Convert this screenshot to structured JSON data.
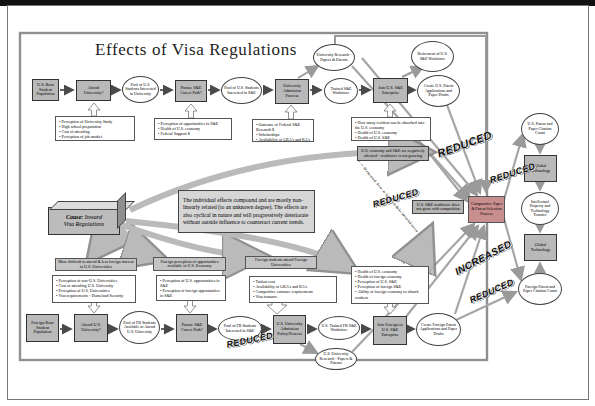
{
  "page_title": "Effects of Visa Regulations",
  "cause_box": {
    "keyword": "Cause:",
    "line1_rest": " Inward",
    "line2": "Visa Regulations"
  },
  "center_note": "The individual effects compound and are mostly non-linearly related (to an unknown degree).  The effects are also cyclical in nature and will progressively deteriorate without outside influence to counteract current trends.",
  "top_row": {
    "n1": "U.S. Born Student Population",
    "n2": "Attend University?",
    "n3": "Pool of U.S. Students Interested in University",
    "n4": "Pursue S&E Career Path?",
    "n5": "Pool of U.S. Students Interested in S&E",
    "n6": "University Admission Process",
    "n7": "Trained S&E Workforce",
    "n8": "Join U.S. S&E Enterprise",
    "n9": "Create U.S. Patent Applications and Paper Drafts",
    "research": "University Research - Papers & Patents",
    "retirement": "Retirement of U.S. S&E Workforce"
  },
  "bottom_row": {
    "n1": "Foreign Born Student Population",
    "n2": "Attend U.S. University?",
    "n3": "Pool of FB Students Available to Attend U.S. University",
    "n4": "Pursue S&E Career Path?",
    "n5": "Pool of FB Students Interested in S&E",
    "n6": "U.S. University Admission Policy/Process",
    "n7": "U.S. Trained FB S&E Workforce",
    "n8": "Join Foreign or U.S. S&E Enterprise",
    "n9": "Create Foreign Patent Applications and Paper Drafts",
    "research": "U.S. University Research - Papers & Patents"
  },
  "right_column": {
    "comparative": "Comparative Paper & Patent Selection Process",
    "us_citations": "U.S. Patent and Paper Citation Count",
    "global_tech_top": "Global Technology",
    "ip_transfer": "Intellectual Property and Technology Transfer",
    "global_tech_bottom": "Global Technology",
    "foreign_citations": "Foreign Patent and Paper Citation Count"
  },
  "labels": {
    "economy_affected": "U.S. economy and S&E are negatively affected - workforce is not growing",
    "workforce_not_grow": "U.S. S&E workforce does not grow with competition",
    "demand_diagonal": "Demand for a U.S. S&E Workforce",
    "more_difficult": "More difficult to attend & less foreign interest in U.S. Universities",
    "foreign_perception": "Foreign perception of opportunities available in U.S. Economy",
    "attend_foreign": "Foreign students attend Foreign Universities"
  },
  "stamps": {
    "s1": "REDUCED",
    "s2": "REDUCED",
    "s3": "REDUCED",
    "s4": "INCREASED",
    "s5": "REDUCED",
    "s6": "REDUCED"
  },
  "bullet_boxes": {
    "university": {
      "items": [
        "Perception of University Study",
        "High school preparation",
        "Cost of attending",
        "Perception of job market"
      ]
    },
    "se_path": {
      "items": [
        "Perception of opportunities in S&E",
        "Health of U.S. economy",
        "Federal Support $"
      ]
    },
    "admission": {
      "items": [
        "Outcome of Federal S&E Research $",
        "Scholarships",
        "Availability of GRA's and RA's"
      ]
    },
    "enterprise": {
      "items": [
        "How many resident can be absorbed into the U.S. economy",
        "Health of U.S. economy",
        "Health of U.S. S&E"
      ]
    },
    "fb_university": {
      "items": [
        "Perception of non-U.S. Universities",
        "Cost of attending U.S. University",
        "Perception of U.S. Universities",
        "Visa requirements - Homeland Security"
      ]
    },
    "fb_se_path": {
      "items": [
        "Perception of U.S. opportunities in S&E",
        "Perception of foreign opportunities in S&E"
      ]
    },
    "fb_admission": {
      "items": [
        "Tuition cost",
        "Availability of GRA's and RA's",
        "Competitive entrance requirements",
        "Visa issuance"
      ]
    },
    "fb_enterprise": {
      "items": [
        "Health of U.S. economy",
        "Health of foreign economy",
        "Perception of U.S. S&E",
        "Perception of foreign S&E",
        "Ability of foreign economy to absorb workers"
      ]
    }
  },
  "colors": {
    "node_fill": "#b9b9b9",
    "comparative_fill": "#c98f8f",
    "note_fill": "#d6d6d6",
    "arrow_grey": "#9a9a9a"
  }
}
